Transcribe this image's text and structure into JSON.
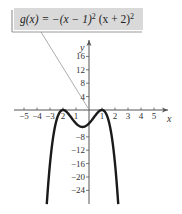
{
  "chart_data": {
    "type": "line",
    "function": "g(x) = -(x-1)^2 (x+2)^2",
    "xlabel": "x",
    "ylabel": "y",
    "xlim": [
      -5.8,
      6.2
    ],
    "ylim": [
      -28,
      19
    ],
    "grid": false,
    "legend": "none",
    "x_ticks": [
      -5,
      -4,
      -3,
      -2,
      -1,
      1,
      2,
      3,
      4,
      5
    ],
    "x_tick_labels": [
      "−5",
      "−4",
      "−3",
      "2",
      "1",
      "1",
      "2",
      "3",
      "4",
      "5"
    ],
    "y_ticks": [
      16,
      12,
      8,
      4,
      -8,
      -12,
      -16,
      -20,
      -24
    ],
    "y_tick_labels": [
      "16",
      "12",
      "8",
      "4",
      "−8",
      "−12",
      "−16",
      "−20",
      "−24"
    ],
    "series": [
      {
        "name": "g(x)",
        "x": [
          -3.25,
          -3.0,
          -2.75,
          -2.5,
          -2.25,
          -2.0,
          -1.75,
          -1.5,
          -1.25,
          -1.0,
          -0.75,
          -0.5,
          -0.25,
          0.0,
          0.25,
          0.5,
          0.75,
          1.0,
          1.25,
          1.5,
          1.75,
          2.0,
          2.25
        ],
        "y": [
          -28.1,
          -16.0,
          -8.3,
          -3.8,
          -1.2,
          0.0,
          -0.4,
          -1.6,
          -3.2,
          -4.0,
          -4.7,
          -5.06,
          -4.7,
          -4.0,
          -2.9,
          -1.6,
          -0.5,
          0.0,
          -0.7,
          -3.1,
          -7.9,
          -16.0,
          -28.1
        ]
      }
    ],
    "annotations": [
      {
        "text": "g(x) = −(x − 1)² (x + 2)²",
        "type": "callout-box",
        "points_to": [
          0,
          0
        ]
      }
    ]
  },
  "colors": {
    "curve": "#1a1a1a",
    "axes": "#555555",
    "callout_fill": "#d9d9d9",
    "callout_shadow": "#9a9a9a",
    "leader_line": "#8a8a8a"
  }
}
